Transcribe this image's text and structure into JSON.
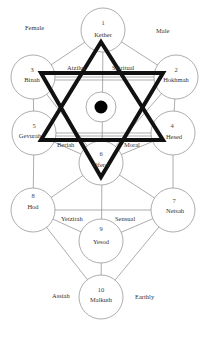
{
  "diagram": {
    "corner_labels": {
      "top_left": "Female",
      "top_right": "Male"
    },
    "sefirot": [
      {
        "number": "1",
        "name": "Kether"
      },
      {
        "number": "2",
        "name": "Hokhmah"
      },
      {
        "number": "3",
        "name": "Binah"
      },
      {
        "number": "4",
        "name": "Hesed"
      },
      {
        "number": "5",
        "name": "Gevurah"
      },
      {
        "number": "6",
        "name": "Tiferet"
      },
      {
        "number": "7",
        "name": "Netsah"
      },
      {
        "number": "8",
        "name": "Hod"
      },
      {
        "number": "9",
        "name": "Yesod"
      },
      {
        "number": "10",
        "name": "Malkuth"
      }
    ],
    "world_labels": {
      "atziluth": "Atzilut",
      "spiritual": "Spiritual",
      "beriah": "Beriah",
      "moral": "Moral",
      "yetzirah": "Yetzirah",
      "sensual": "Sensual",
      "assiah": "Assiah",
      "earthly": "Earthly"
    },
    "colors": {
      "lines": "#8a8a8a",
      "hexagram": "#111111",
      "daat_dot": "#000000"
    }
  }
}
